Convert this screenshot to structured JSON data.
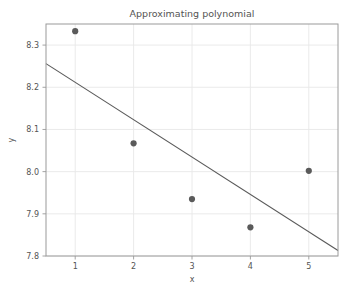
{
  "chart_data": {
    "type": "scatter",
    "title": "Approximating polynomial",
    "xlabel": "x",
    "ylabel": "y",
    "grid": true,
    "legend": null,
    "xlim": [
      0.5,
      5.5
    ],
    "ylim": [
      7.8,
      8.35
    ],
    "xticks": [
      1,
      2,
      3,
      4,
      5
    ],
    "xtick_labels": [
      "1",
      "2",
      "3",
      "4",
      "5"
    ],
    "yticks": [
      7.8,
      7.9,
      8.0,
      8.1,
      8.2,
      8.3
    ],
    "ytick_labels": [
      "7.8",
      "7.9",
      "8.0",
      "8.1",
      "8.2",
      "8.3"
    ],
    "series": [
      {
        "name": "data points",
        "type": "scatter",
        "marker": "circle",
        "color": "#5a5a5a",
        "x": [
          1,
          2,
          3,
          4,
          5
        ],
        "values": [
          8.333,
          8.067,
          7.935,
          7.868,
          8.002
        ]
      },
      {
        "name": "approximating polynomial",
        "type": "line",
        "color": "#5a5a5a",
        "x": [
          0.5,
          5.5
        ],
        "values": [
          8.256,
          7.813
        ]
      }
    ]
  },
  "colors": {
    "marker": "#5a5a5a",
    "line": "#5a5a5a",
    "grid": "#e8e8e8",
    "spine": "#9a9a9a",
    "text": "#545454",
    "background": "#ffffff"
  }
}
